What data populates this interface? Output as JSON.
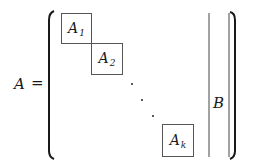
{
  "equation": {
    "lhs": "A",
    "equals": "=",
    "blocks": [
      {
        "base": "A",
        "subscript": "1"
      },
      {
        "base": "A",
        "subscript": "2"
      },
      {
        "base": "A",
        "subscript": "k"
      }
    ],
    "dots": "⋱",
    "right_block": "B"
  },
  "colors": {
    "ink": "#1a1a1a",
    "box_border": "#555555",
    "background": "#ffffff"
  }
}
